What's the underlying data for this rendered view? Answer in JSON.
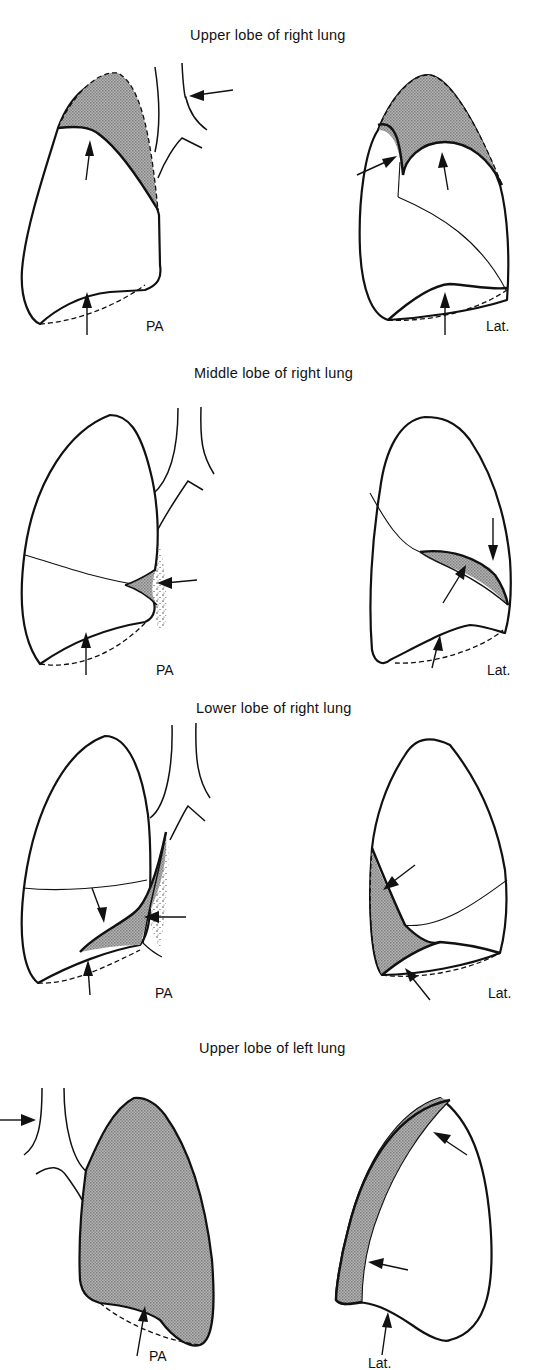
{
  "header_fragment": "",
  "sections": [
    {
      "title": "Upper lobe of right lung",
      "views": [
        {
          "label": "PA"
        },
        {
          "label": "Lat."
        }
      ]
    },
    {
      "title": "Middle lobe of right lung",
      "views": [
        {
          "label": "PA"
        },
        {
          "label": "Lat."
        }
      ]
    },
    {
      "title": "Lower lobe of right lung",
      "views": [
        {
          "label": "PA"
        },
        {
          "label": "Lat."
        }
      ]
    },
    {
      "title": "Upper lobe of left lung",
      "views": [
        {
          "label": "PA"
        },
        {
          "label": "Lat."
        }
      ]
    }
  ],
  "colors": {
    "ink": "#111111",
    "shading": "#9a9a9a",
    "background": "#ffffff"
  }
}
